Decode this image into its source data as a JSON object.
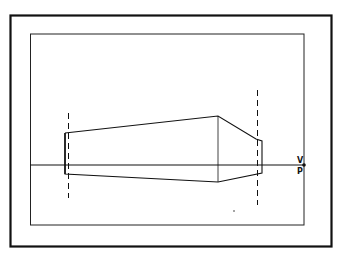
{
  "diagram": {
    "type": "perspective-drawing",
    "labels": {
      "vanishing_point_top": "V",
      "vanishing_point_bottom": "P"
    },
    "colors": {
      "ink": "#111111",
      "paper": "#ffffff"
    },
    "outer_frame": {
      "x": 10,
      "y": 15,
      "w": 322,
      "h": 232
    },
    "inner_frame": {
      "x": 30,
      "y": 34,
      "w": 274,
      "h": 191
    },
    "horizon_line_y": 165,
    "vanishing_point": {
      "x": 304,
      "y": 165
    }
  }
}
